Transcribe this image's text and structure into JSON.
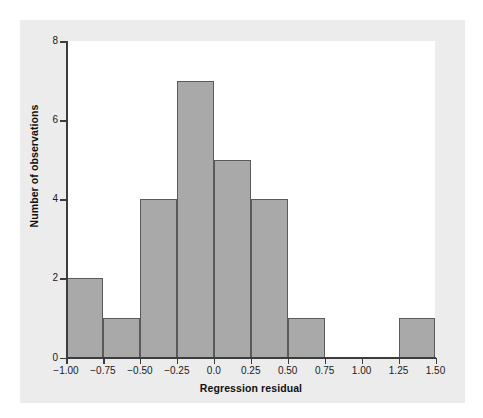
{
  "chart_data": {
    "type": "bar",
    "title": "",
    "xlabel": "Regression residual",
    "ylabel": "Number of observations",
    "bin_width": 0.25,
    "bin_edges": [
      -1.0,
      -0.75,
      -0.5,
      -0.25,
      0.0,
      0.25,
      0.5,
      0.75,
      1.0,
      1.25,
      1.5
    ],
    "categories": [
      "-1.00 to -0.75",
      "-0.75 to -0.50",
      "-0.50 to -0.25",
      "-0.25 to 0.00",
      "0.00 to 0.25",
      "0.25 to 0.50",
      "0.50 to 0.75",
      "0.75 to 1.00",
      "1.00 to 1.25",
      "1.25 to 1.50"
    ],
    "values": [
      2,
      1,
      4,
      7,
      5,
      4,
      1,
      0,
      0,
      1
    ],
    "xlim": [
      -1.0,
      1.5
    ],
    "ylim": [
      0,
      8
    ],
    "xticks": [
      -1.0,
      -0.75,
      -0.5,
      -0.25,
      0.0,
      0.25,
      0.5,
      0.75,
      1.0,
      1.25,
      1.5
    ],
    "xtick_labels": [
      "−1.00",
      "−0.75",
      "−0.50",
      "−0.25",
      "0.0",
      "0.25",
      "0.50",
      "0.75",
      "1.00",
      "1.25",
      "1.50"
    ],
    "yticks": [
      0,
      2,
      4,
      6,
      8
    ],
    "ytick_labels": [
      "0",
      "2",
      "4",
      "6",
      "8"
    ],
    "grid": false,
    "legend": null,
    "bar_fill_color": "#a9a9a9",
    "bar_edge_color": "#5a5a5a",
    "panel_background_color": "#ececec",
    "plot_background_color": "#ffffff",
    "axis_color": "#3c3c3c",
    "total_observations": 25
  }
}
